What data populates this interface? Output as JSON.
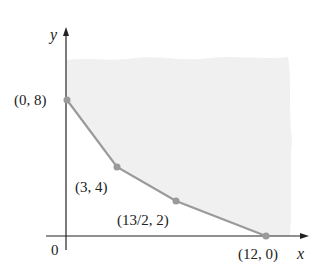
{
  "diagram": {
    "type": "feasible-region-graph",
    "axes": {
      "x_label": "x",
      "y_label": "y",
      "origin_label": "0"
    },
    "vertices": [
      {
        "label": "(0, 8)",
        "x": 0,
        "y": 8
      },
      {
        "label": "(3, 4)",
        "x": 3,
        "y": 4
      },
      {
        "label": "(13/2, 2)",
        "x": 6.5,
        "y": 2
      },
      {
        "label": "(12, 0)",
        "x": 12,
        "y": 0
      }
    ],
    "region": {
      "description": "unbounded shaded region above the boundary",
      "fill_color": "#f0f0f0"
    },
    "colors": {
      "axis": "#222222",
      "boundary": "#9a9a9a",
      "point": "#9a9a9a",
      "region": "#f0f0f0"
    }
  }
}
